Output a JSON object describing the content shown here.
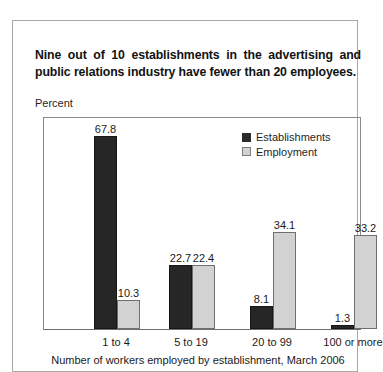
{
  "card": {
    "title_line1": "Nine out of 10 establishments in the advertising and",
    "title_line2": "public relations industry have fewer than 20 employees."
  },
  "chart_data": {
    "type": "bar",
    "title": "Nine out of 10 establishments in the advertising and public relations industry have fewer than 20 employees.",
    "xlabel": "Number of workers employed by establishment, March 2006",
    "ylabel": "Percent",
    "categories": [
      "1 to 4",
      "5 to 19",
      "20 to 99",
      "100 or more"
    ],
    "series": [
      {
        "name": "Establishments",
        "color": "#262626",
        "values": [
          67.8,
          22.7,
          8.1,
          1.3
        ]
      },
      {
        "name": "Employment",
        "color": "#d2d2d2",
        "values": [
          10.3,
          22.4,
          34.1,
          33.2
        ]
      }
    ],
    "value_labels": {
      "establishments": [
        "67.8",
        "22.7",
        "8.1",
        "1.3"
      ],
      "employment": [
        "10.3",
        "22.4",
        "34.1",
        "33.2"
      ]
    },
    "ylim": [
      0,
      75
    ],
    "grid": false,
    "legend_position": "top-right"
  },
  "legend": {
    "items": [
      {
        "label": "Establishments",
        "swatch": "dark"
      },
      {
        "label": "Employment",
        "swatch": "light"
      }
    ]
  }
}
